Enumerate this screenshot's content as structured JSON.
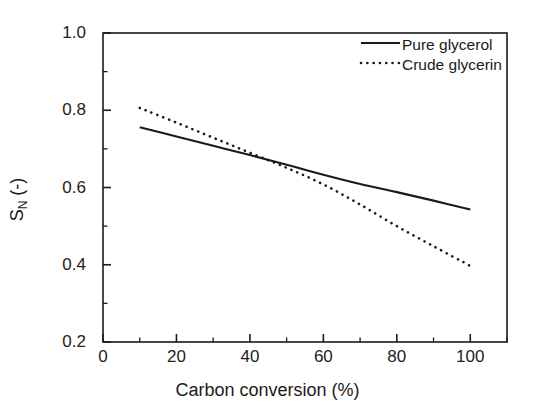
{
  "chart_data": {
    "type": "line",
    "title": "",
    "subtitle": "",
    "xlabel": "Carbon conversion (%)",
    "ylabel": "S_N (-)",
    "ylabel_base": "S",
    "ylabel_sub": "N",
    "ylabel_unit": " (-)",
    "xlim": [
      0,
      110
    ],
    "ylim": [
      0.2,
      1.0
    ],
    "grid": false,
    "legend_position": "top-right inside plot area",
    "x_major_ticks": [
      0,
      20,
      40,
      60,
      80,
      100
    ],
    "x_minor_ticks": [
      10,
      30,
      50,
      70,
      90,
      110
    ],
    "y_major_ticks": [
      0.2,
      0.4,
      0.6,
      0.8,
      1.0
    ],
    "y_minor_ticks": [
      0.3,
      0.5,
      0.7,
      0.9
    ],
    "x_tick_labels": [
      "0",
      "20",
      "40",
      "60",
      "80",
      "100"
    ],
    "y_tick_labels": [
      "0.2",
      "0.4",
      "0.6",
      "0.8",
      "1.0"
    ],
    "series": [
      {
        "name": "Pure glycerol",
        "style": "solid",
        "color": "#1a1a1a",
        "x": [
          10,
          20,
          30,
          40,
          50,
          60,
          70,
          80,
          90,
          100
        ],
        "values": [
          0.756,
          0.732,
          0.708,
          0.684,
          0.659,
          0.633,
          0.609,
          0.588,
          0.566,
          0.543
        ]
      },
      {
        "name": "Crude glycerin",
        "style": "dotted",
        "color": "#1a1a1a",
        "x": [
          10,
          20,
          30,
          40,
          50,
          60,
          70,
          80,
          90,
          100
        ],
        "values": [
          0.806,
          0.768,
          0.729,
          0.69,
          0.651,
          0.608,
          0.556,
          0.5,
          0.448,
          0.397
        ]
      }
    ],
    "annotations": [],
    "crossover_point": {
      "x": 53,
      "y": 0.651
    }
  },
  "legend": {
    "items": [
      {
        "label": "Pure glycerol",
        "style": "solid"
      },
      {
        "label": "Crude glycerin",
        "style": "dotted"
      }
    ]
  },
  "colors": {
    "background": "#ffffff",
    "axis": "#1a1a1a",
    "series_1": "#1a1a1a",
    "series_2": "#1a1a1a"
  }
}
